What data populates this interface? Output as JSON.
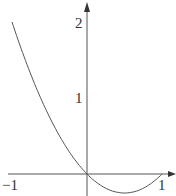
{
  "chart_data": {
    "type": "line",
    "title": "",
    "xlabel": "",
    "ylabel": "",
    "function": "y = x^2 - x",
    "xlim": [
      -1,
      1
    ],
    "ylim": [
      -0.25,
      2
    ],
    "grid": false,
    "x_ticks": [
      "-1",
      "1"
    ],
    "y_ticks": [
      "1",
      "2"
    ],
    "series": [
      {
        "name": "curve",
        "x": [
          -1,
          -0.75,
          -0.5,
          -0.25,
          0,
          0.25,
          0.5,
          0.75,
          1
        ],
        "y": [
          2,
          1.3125,
          0.75,
          0.3125,
          0,
          -0.1875,
          -0.25,
          -0.1875,
          0
        ]
      }
    ],
    "colors": {
      "axis": "#444444",
      "curve": "#555555"
    }
  },
  "labels": {
    "x_neg1": "−1",
    "x_pos1": "1",
    "y_1": "1",
    "y_2": "2"
  }
}
